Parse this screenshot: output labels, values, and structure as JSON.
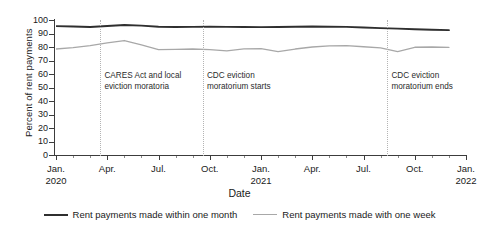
{
  "chart_data": {
    "type": "line",
    "title": "",
    "xlabel": "Date",
    "ylabel": "Percent of rent payments",
    "ylim": [
      0,
      100
    ],
    "ytick_values": [
      0,
      10,
      20,
      30,
      40,
      50,
      60,
      70,
      80,
      90,
      100
    ],
    "grid": false,
    "legend_position": "bottom",
    "x": [
      "Jan. 2020",
      "Feb. 2020",
      "Mar. 2020",
      "Apr. 2020",
      "May 2020",
      "Jun. 2020",
      "Jul. 2020",
      "Aug. 2020",
      "Sep. 2020",
      "Oct. 2020",
      "Nov. 2020",
      "Dec. 2020",
      "Jan. 2021",
      "Feb. 2021",
      "Mar. 2021",
      "Apr. 2021",
      "May 2021",
      "Jun. 2021",
      "Jul. 2021",
      "Aug. 2021",
      "Sep. 2021",
      "Oct. 2021",
      "Nov. 2021",
      "Dec. 2021"
    ],
    "series": [
      {
        "name": "Rent payments made within one month",
        "color": "#2f2f2f",
        "values": [
          95.5,
          95.2,
          94.8,
          95.6,
          96.3,
          95.8,
          95.0,
          94.8,
          94.9,
          95.0,
          94.9,
          94.8,
          94.7,
          94.8,
          95.0,
          95.2,
          95.0,
          94.9,
          94.5,
          94.0,
          93.6,
          93.2,
          92.8,
          92.5
        ]
      },
      {
        "name": "Rent payments made with one week",
        "color": "#a8a8a8",
        "values": [
          78.5,
          79.5,
          81.0,
          83.0,
          84.8,
          81.5,
          78.0,
          78.2,
          78.5,
          78.0,
          77.2,
          78.6,
          78.8,
          76.6,
          78.5,
          80.0,
          80.8,
          81.0,
          80.2,
          79.4,
          76.6,
          79.8,
          80.0,
          79.7
        ]
      }
    ],
    "xtick_labels": [
      {
        "month": "Jan.",
        "year": "2020"
      },
      {
        "month": "Apr.",
        "year": ""
      },
      {
        "month": "Jul.",
        "year": ""
      },
      {
        "month": "Oct.",
        "year": ""
      },
      {
        "month": "Jan.",
        "year": "2021"
      },
      {
        "month": "Apr.",
        "year": ""
      },
      {
        "month": "Jul.",
        "year": ""
      },
      {
        "month": "Oct.",
        "year": ""
      },
      {
        "month": "Jan.",
        "year": "2022"
      }
    ],
    "annotations": [
      {
        "text": "CARES Act and local eviction moratoria",
        "x_position": "Mar. 2020"
      },
      {
        "text": "CDC eviction moratorium starts",
        "x_position": "Sep. 2020"
      },
      {
        "text": "CDC eviction moratorium ends",
        "x_position": "Aug. 2021"
      }
    ]
  },
  "legend": {
    "items": [
      {
        "label": "Rent payments made within one month"
      },
      {
        "label": "Rent payments made with one week"
      }
    ]
  },
  "colors": {
    "series_dark": "#2f2f2f",
    "series_light": "#a8a8a8",
    "axis": "#3c3c3c",
    "annotation_line": "#b4b4b4"
  }
}
